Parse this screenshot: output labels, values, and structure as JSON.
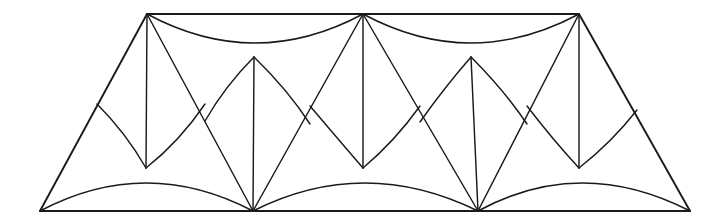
{
  "figure": {
    "background_color": "#ffffff",
    "stroke_color": "#1a1a1a",
    "stroke_width": 1.45,
    "frame_stroke_width": 1.9,
    "canvas": {
      "width": 727,
      "height": 218
    },
    "vertices": {
      "top_row_y": 14,
      "upper_mid_y": 57,
      "lower_mid_y": 168,
      "bottom_row_y": 211,
      "top": [
        {
          "name": "T1",
          "x": 147,
          "y": 14
        },
        {
          "name": "T2",
          "x": 363,
          "y": 14
        },
        {
          "name": "T3",
          "x": 579,
          "y": 14
        }
      ],
      "upper_mid": [
        {
          "name": "U1",
          "x": 254,
          "y": 57
        },
        {
          "name": "U2",
          "x": 471,
          "y": 57
        }
      ],
      "lower_mid": [
        {
          "name": "L1",
          "x": 146,
          "y": 168
        },
        {
          "name": "L2",
          "x": 363,
          "y": 168
        },
        {
          "name": "L3",
          "x": 579,
          "y": 168
        }
      ],
      "bottom": [
        {
          "name": "B0",
          "x": 40,
          "y": 211
        },
        {
          "name": "B1",
          "x": 253,
          "y": 211
        },
        {
          "name": "B2",
          "x": 478,
          "y": 211
        },
        {
          "name": "B3",
          "x": 690,
          "y": 211
        }
      ]
    },
    "outline": {
      "name": "trapezoid-outline",
      "points": "40,211 147,14 579,14 690,211"
    },
    "straight_segments": [
      {
        "name": "left-slant-edge",
        "from": "B0",
        "to": "T1",
        "d": "M 40 211 L 147 14"
      },
      {
        "name": "right-slant-edge",
        "from": "B3",
        "to": "T3",
        "d": "M 690 211 L 579 14"
      },
      {
        "name": "top-edge",
        "from": "T1",
        "to": "T3",
        "d": "M 147 14 L 579 14"
      },
      {
        "name": "bottom-edge",
        "from": "B0",
        "to": "B3",
        "d": "M 40 211 L 690 211"
      },
      {
        "name": "vertical-T1-L1",
        "d": "M 147 14 L 146 168"
      },
      {
        "name": "vertical-T2-L2",
        "d": "M 363 14 L 363 168"
      },
      {
        "name": "vertical-T3-L3",
        "d": "M 579 14 L 579 168"
      },
      {
        "name": "vertical-U1-B1",
        "d": "M 254 57 L 253 211"
      },
      {
        "name": "vertical-U2-B2",
        "d": "M 471 57 L 478 211"
      },
      {
        "name": "diagonal-T1-B1",
        "d": "M 147 14 L 253 211"
      },
      {
        "name": "diagonal-T2-B1",
        "d": "M 363 14 L 253 211"
      },
      {
        "name": "diagonal-T2-B2",
        "d": "M 363 14 L 478 211"
      },
      {
        "name": "diagonal-T3-B2",
        "d": "M 579 14 L 478 211"
      }
    ],
    "arcs": [
      {
        "name": "top-arc-T1-U1-T2",
        "d": "M 147 14 Q 255 72 363 14",
        "sag": "down"
      },
      {
        "name": "top-arc-T2-U2-T3",
        "d": "M 363 14 Q 471 72 579 14",
        "sag": "down"
      },
      {
        "name": "bottom-arc-B0-L1-B1",
        "d": "M 40 211 Q 146 155 253 211",
        "sag": "up"
      },
      {
        "name": "bottom-arc-B1-L2-B2",
        "d": "M 253 211 Q 364 155 478 211",
        "sag": "up"
      },
      {
        "name": "bottom-arc-B2-L3-B3",
        "d": "M 478 211 Q 581 155 690 211",
        "sag": "up"
      },
      {
        "name": "cusp-L1-up-left",
        "d": "M 146 168 Q 126 133 97 104",
        "curve": "concave"
      },
      {
        "name": "cusp-L1-up-right",
        "d": "M 146 168 Q 180 141 205 104",
        "curve": "concave"
      },
      {
        "name": "cusp-U1-down-left",
        "d": "M 254 57 Q 225 86 205 121",
        "curve": "concave"
      },
      {
        "name": "cusp-U1-down-right",
        "d": "M 254 57 Q 288 90 310 124",
        "curve": "concave"
      },
      {
        "name": "cusp-L2-up-left",
        "d": "M 363 168 Q 338 139 310 106",
        "curve": "concave"
      },
      {
        "name": "cusp-L2-up-right",
        "d": "M 363 168 Q 395 141 420 106",
        "curve": "concave"
      },
      {
        "name": "cusp-U2-down-left",
        "d": "M 471 57 Q 444 88 420 122",
        "curve": "concave"
      },
      {
        "name": "cusp-U2-down-right",
        "d": "M 471 57 Q 504 90 527 124",
        "curve": "concave"
      },
      {
        "name": "cusp-L3-up-left",
        "d": "M 579 168 Q 553 140 527 106",
        "curve": "concave"
      },
      {
        "name": "cusp-L3-up-right",
        "d": "M 579 168 Q 612 142 637 110",
        "curve": "concave"
      }
    ]
  }
}
